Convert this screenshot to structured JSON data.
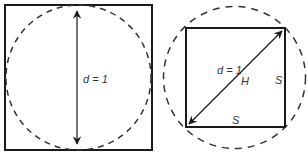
{
  "left_figure": {
    "label_diameter": "d = 1",
    "description": "Circle inscribed in a square; vertical diameter arrow"
  },
  "right_figure": {
    "label_diameter": "d = 1",
    "label_hypotenuse": "H",
    "label_side_right": "S",
    "label_side_bottom": "S",
    "description": "Square inscribed in a circle; diagonal arrow equals diameter"
  },
  "colors": {
    "stroke": "#1a1a1a",
    "text": "#333333",
    "background": "#ffffff"
  }
}
